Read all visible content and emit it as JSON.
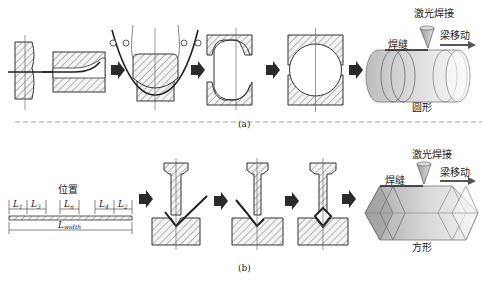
{
  "figure": {
    "part_a": {
      "caption": "(a)",
      "shape_label": "圆形",
      "weld_seam_label": "焊缝",
      "laser_weld_label": "激光焊接",
      "beam_move_label": "梁移动",
      "steps": [
        "strip-feed",
        "edge-bending",
        "u-forming",
        "o-forming-open",
        "o-forming-closed",
        "laser-welding-round-tube"
      ]
    },
    "part_b": {
      "caption": "(b)",
      "shape_label": "方形",
      "weld_seam_label": "焊缝",
      "laser_weld_label": "激光焊接",
      "beam_move_label": "梁移动",
      "position_label": "位置",
      "dimensions": {
        "L1": "L",
        "L1_sub": "1",
        "L3": "L",
        "L3_sub": "3",
        "Ln": "L",
        "Ln_sub": "n",
        "L4": "L",
        "L4_sub": "4",
        "L2": "L",
        "L2_sub": "2",
        "Lwidth": "L",
        "Lwidth_sub": "width"
      },
      "steps": [
        "blank-with-bend-positions",
        "v-bending-1",
        "v-bending-2",
        "final-bend-closed",
        "laser-welding-square-tube"
      ]
    },
    "colors": {
      "line": "#333333",
      "hatch": "#555555",
      "arrow": "#2a2a2a",
      "tube_fill": "#cfcfcf",
      "divider": "#888888"
    }
  }
}
